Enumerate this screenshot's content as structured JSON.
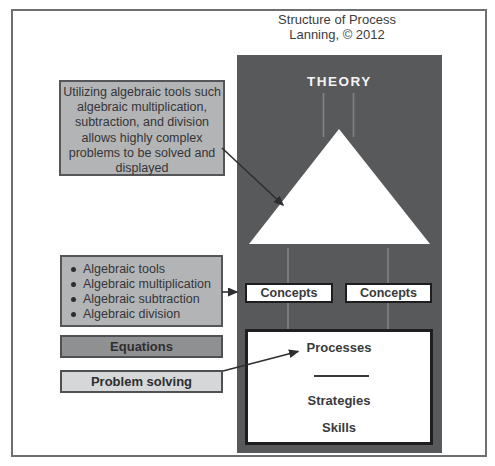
{
  "title": {
    "line1": "Structure of Process",
    "line2": "Lanning, © 2012"
  },
  "pyramid": {
    "theory": "THEORY",
    "principle_line1": "PRINCIPLE",
    "principle_line2": "GENERALIZATION",
    "concepts_left": "Concepts",
    "concepts_right": "Concepts",
    "processes": "Processes",
    "strategies": "Strategies",
    "skills": "Skills"
  },
  "callout": {
    "lines": [
      "Utilizing algebraic tools such",
      "algebraic multiplication,",
      "subtraction, and division",
      "allows highly complex",
      "problems to be solved and",
      "displayed"
    ]
  },
  "bullets": {
    "items": [
      "Algebraic tools",
      "Algebraic multiplication",
      "Algebraic subtraction",
      "Algebraic division"
    ]
  },
  "labels": {
    "equations": "Equations",
    "problem_solving": "Problem solving"
  },
  "colors": {
    "dark_panel": "#58595b",
    "gray_note": "#b3b4b6",
    "equations_bar": "#8e9092",
    "problem_bar": "#d6d7d8",
    "connector_line": "#818284",
    "arrow": "#2e2e30"
  }
}
